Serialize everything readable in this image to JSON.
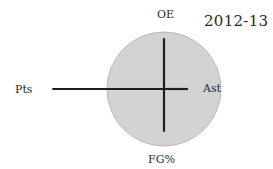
{
  "chart_data": {
    "type": "radar-axes",
    "title": "2012-13",
    "center": [
      164,
      89
    ],
    "radius": 57,
    "axes": [
      {
        "name": "OE",
        "direction": "up",
        "value": 0.89
      },
      {
        "name": "Ast",
        "direction": "right",
        "value": 0.42
      },
      {
        "name": "FG%",
        "direction": "down",
        "value": 0.75
      },
      {
        "name": "Pts",
        "direction": "left",
        "value": 1.96
      }
    ],
    "reference_circle": {
      "value": 1.0,
      "fill": "#d3d3d3",
      "stroke": "#b8b8b8"
    },
    "line_color": "#1e1e1e",
    "grid": false,
    "legend": null
  },
  "labels": {
    "title": "2012-13",
    "top": "OE",
    "right": "Ast",
    "bottom": "FG%",
    "left": "Pts"
  }
}
